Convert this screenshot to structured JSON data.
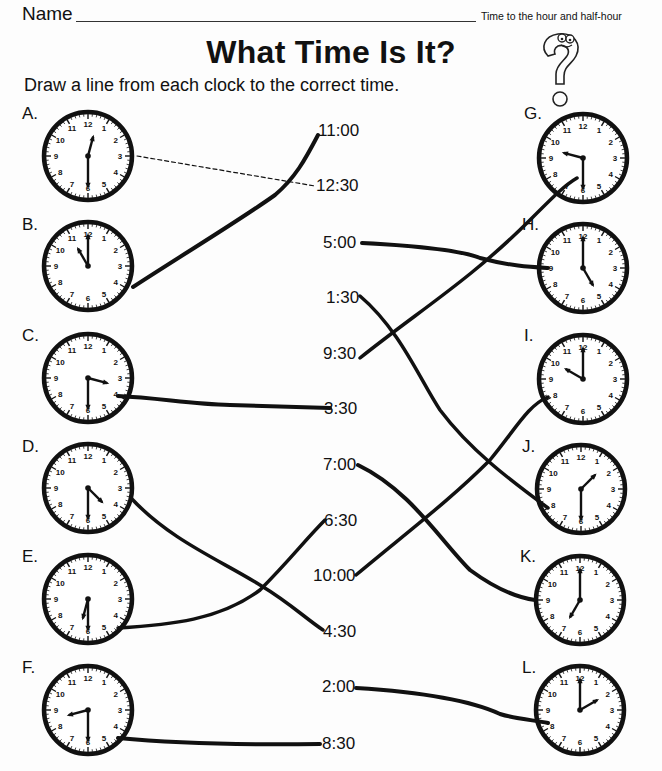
{
  "header": {
    "name_label": "Name",
    "subtitle": "Time to the hour and half-hour",
    "title": "What Time Is It?",
    "instructions": "Draw a line from each clock to the correct time."
  },
  "left_clocks": [
    {
      "letter": "A.",
      "time": "12:30",
      "hour": 12,
      "minute": 30
    },
    {
      "letter": "B.",
      "time": "11:00",
      "hour": 11,
      "minute": 0
    },
    {
      "letter": "C.",
      "time": "3:30",
      "hour": 3,
      "minute": 30
    },
    {
      "letter": "D.",
      "time": "4:30",
      "hour": 4,
      "minute": 30
    },
    {
      "letter": "E.",
      "time": "6:30",
      "hour": 6,
      "minute": 30
    },
    {
      "letter": "F.",
      "time": "8:30",
      "hour": 8,
      "minute": 30
    }
  ],
  "right_clocks": [
    {
      "letter": "G.",
      "time": "9:30",
      "hour": 9,
      "minute": 30
    },
    {
      "letter": "H.",
      "time": "5:00",
      "hour": 5,
      "minute": 0
    },
    {
      "letter": "I.",
      "time": "10:00",
      "hour": 10,
      "minute": 0
    },
    {
      "letter": "J.",
      "time": "1:30",
      "hour": 1,
      "minute": 30
    },
    {
      "letter": "K.",
      "time": "7:00",
      "hour": 7,
      "minute": 0
    },
    {
      "letter": "L.",
      "time": "2:00",
      "hour": 2,
      "minute": 0
    }
  ],
  "times": [
    "11:00",
    "12:30",
    "5:00",
    "1:30",
    "9:30",
    "3:30",
    "7:00",
    "6:30",
    "10:00",
    "4:30",
    "2:00",
    "8:30"
  ],
  "drawn_matches": [
    {
      "clock": "A",
      "time": "12:30",
      "style": "dashed-example"
    },
    {
      "clock": "B",
      "time": "11:00"
    },
    {
      "clock": "C",
      "time": "3:30"
    },
    {
      "clock": "D",
      "time": "4:30"
    },
    {
      "clock": "E",
      "time": "6:30"
    },
    {
      "clock": "F",
      "time": "8:30"
    },
    {
      "clock": "G",
      "time": "9:30"
    },
    {
      "clock": "H",
      "time": "5:00"
    },
    {
      "clock": "I",
      "time": "10:00"
    },
    {
      "clock": "J",
      "time": "1:30"
    },
    {
      "clock": "K",
      "time": "7:00"
    },
    {
      "clock": "L",
      "time": "2:00"
    }
  ],
  "colors": {
    "ink": "#111111",
    "paper": "#fdfdfd"
  }
}
